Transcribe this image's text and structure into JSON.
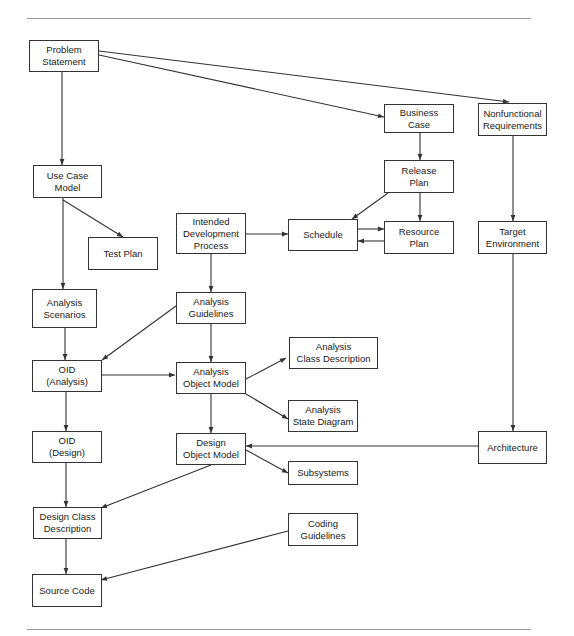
{
  "diagram": {
    "type": "flowchart",
    "colors": {
      "stroke": "#333333",
      "text": "#1a1a1a",
      "rule": "#9a9a9a",
      "background": "#ffffff"
    },
    "nodes": [
      {
        "id": "problem_statement",
        "label": "Problem\nStatement"
      },
      {
        "id": "business_case",
        "label": "Business\nCase"
      },
      {
        "id": "nonfunctional_requirements",
        "label": "Nonfunctional\nRequirements"
      },
      {
        "id": "use_case_model",
        "label": "Use Case\nModel"
      },
      {
        "id": "release_plan",
        "label": "Release\nPlan"
      },
      {
        "id": "intended_development_process",
        "label": "Intended\nDevelopment\nProcess"
      },
      {
        "id": "schedule",
        "label": "Schedule"
      },
      {
        "id": "resource_plan",
        "label": "Resource\nPlan"
      },
      {
        "id": "target_environment",
        "label": "Target\nEnvironment"
      },
      {
        "id": "test_plan",
        "label": "Test Plan"
      },
      {
        "id": "analysis_scenarios",
        "label": "Analysis\nScenarios"
      },
      {
        "id": "analysis_guidelines",
        "label": "Analysis\nGuidelines"
      },
      {
        "id": "analysis_class_description",
        "label": "Analysis\nClass Description"
      },
      {
        "id": "oid_analysis",
        "label": "OID\n(Analysis)"
      },
      {
        "id": "analysis_object_model",
        "label": "Analysis\nObject Model"
      },
      {
        "id": "analysis_state_diagram",
        "label": "Analysis\nState Diagram"
      },
      {
        "id": "oid_design",
        "label": "OID\n(Design)"
      },
      {
        "id": "design_object_model",
        "label": "Design\nObject Model"
      },
      {
        "id": "architecture",
        "label": "Architecture"
      },
      {
        "id": "subsystems",
        "label": "Subsystems"
      },
      {
        "id": "design_class_description",
        "label": "Design Class\nDescription"
      },
      {
        "id": "coding_guidelines",
        "label": "Coding\nGuidelines"
      },
      {
        "id": "source_code",
        "label": "Source Code"
      }
    ],
    "edges": [
      {
        "from": "problem_statement",
        "to": "use_case_model"
      },
      {
        "from": "problem_statement",
        "to": "business_case"
      },
      {
        "from": "problem_statement",
        "to": "nonfunctional_requirements"
      },
      {
        "from": "business_case",
        "to": "release_plan"
      },
      {
        "from": "release_plan",
        "to": "schedule"
      },
      {
        "from": "release_plan",
        "to": "resource_plan"
      },
      {
        "from": "schedule",
        "to": "resource_plan"
      },
      {
        "from": "resource_plan",
        "to": "schedule"
      },
      {
        "from": "intended_development_process",
        "to": "schedule"
      },
      {
        "from": "intended_development_process",
        "to": "analysis_guidelines"
      },
      {
        "from": "nonfunctional_requirements",
        "to": "target_environment"
      },
      {
        "from": "target_environment",
        "to": "architecture"
      },
      {
        "from": "use_case_model",
        "to": "test_plan"
      },
      {
        "from": "use_case_model",
        "to": "analysis_scenarios"
      },
      {
        "from": "analysis_scenarios",
        "to": "oid_analysis"
      },
      {
        "from": "analysis_guidelines",
        "to": "oid_analysis"
      },
      {
        "from": "analysis_guidelines",
        "to": "analysis_object_model"
      },
      {
        "from": "oid_analysis",
        "to": "analysis_object_model"
      },
      {
        "from": "oid_analysis",
        "to": "oid_design"
      },
      {
        "from": "analysis_object_model",
        "to": "analysis_class_description"
      },
      {
        "from": "analysis_object_model",
        "to": "analysis_state_diagram"
      },
      {
        "from": "analysis_object_model",
        "to": "design_object_model"
      },
      {
        "from": "architecture",
        "to": "design_object_model"
      },
      {
        "from": "design_object_model",
        "to": "subsystems"
      },
      {
        "from": "design_object_model",
        "to": "design_class_description"
      },
      {
        "from": "oid_design",
        "to": "design_class_description"
      },
      {
        "from": "design_class_description",
        "to": "source_code"
      },
      {
        "from": "coding_guidelines",
        "to": "source_code"
      }
    ]
  }
}
